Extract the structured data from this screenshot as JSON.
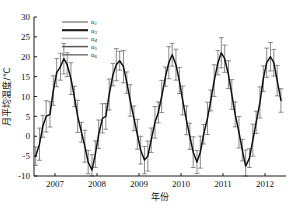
{
  "chart_data": {
    "type": "line",
    "title": "",
    "xlabel": "年份",
    "ylabel": "月平均温度/℃",
    "ylim": [
      -10,
      30
    ],
    "yticks": [
      -10,
      -5,
      0,
      5,
      10,
      15,
      20,
      25,
      30
    ],
    "yticklabels": [
      "-10",
      "-5",
      "0",
      "5",
      "10",
      "15",
      "20",
      "25",
      "30"
    ],
    "xlim": [
      2006.5,
      2012.5
    ],
    "xticks": [
      2007,
      2008,
      2009,
      2010,
      2011,
      2012
    ],
    "xticklabels": [
      "2007",
      "2008",
      "2009",
      "2010",
      "2011",
      "2012"
    ],
    "grid": false,
    "legend_position": "upper-left-inset",
    "legend": [
      {
        "label": "u",
        "sub": "1",
        "color": "#8a8a8a"
      },
      {
        "label": "u",
        "sub": "3",
        "color": "#1a1a1a"
      },
      {
        "label": "u",
        "sub": "4",
        "color": "#b4b4b4"
      },
      {
        "label": "u",
        "sub": "5",
        "color": "#5a5a5a"
      },
      {
        "label": "u",
        "sub": "6",
        "color": "#777777"
      }
    ],
    "series": [
      {
        "name": "monthly mean temperature",
        "color": "#111111",
        "x": [
          2006.54,
          2006.63,
          2006.71,
          2006.79,
          2006.88,
          2006.96,
          2007.04,
          2007.13,
          2007.21,
          2007.29,
          2007.38,
          2007.46,
          2007.54,
          2007.63,
          2007.71,
          2007.79,
          2007.88,
          2007.96,
          2008.04,
          2008.13,
          2008.21,
          2008.29,
          2008.38,
          2008.46,
          2008.54,
          2008.63,
          2008.71,
          2008.79,
          2008.88,
          2008.96,
          2009.04,
          2009.13,
          2009.21,
          2009.29,
          2009.38,
          2009.46,
          2009.54,
          2009.63,
          2009.71,
          2009.79,
          2009.88,
          2009.96,
          2010.04,
          2010.13,
          2010.21,
          2010.29,
          2010.38,
          2010.46,
          2010.54,
          2010.63,
          2010.71,
          2010.79,
          2010.88,
          2010.96,
          2011.04,
          2011.13,
          2011.21,
          2011.29,
          2011.38,
          2011.46,
          2011.54,
          2011.63,
          2011.71,
          2011.79,
          2011.88,
          2011.96,
          2012.04,
          2012.13,
          2012.21,
          2012.29,
          2012.38
        ],
        "y": [
          -5.0,
          -2.0,
          2.5,
          5.0,
          5.5,
          11.5,
          16.0,
          17.5,
          19.5,
          18.0,
          14.5,
          10.0,
          5.0,
          1.0,
          -2.5,
          -6.5,
          -8.5,
          -4.5,
          0.5,
          4.5,
          5.0,
          10.5,
          15.5,
          18.0,
          19.0,
          17.5,
          13.5,
          9.0,
          4.5,
          0.5,
          -3.5,
          -6.0,
          -5.0,
          -1.0,
          3.5,
          6.0,
          10.0,
          15.0,
          18.5,
          20.5,
          18.0,
          14.0,
          9.0,
          4.0,
          0.0,
          -4.0,
          -6.5,
          -4.0,
          0.5,
          4.5,
          9.0,
          14.0,
          18.5,
          21.0,
          19.5,
          15.5,
          10.5,
          5.5,
          1.0,
          -3.5,
          -7.5,
          -5.5,
          -1.0,
          3.5,
          8.5,
          14.5,
          18.5,
          20.0,
          18.5,
          14.0,
          9.0
        ]
      }
    ],
    "error_bars": {
      "present": true,
      "color": "#6e6e6e",
      "typical_half_width": 3.2,
      "description": "vertical whisker error bars with caps on each monthly point"
    }
  }
}
